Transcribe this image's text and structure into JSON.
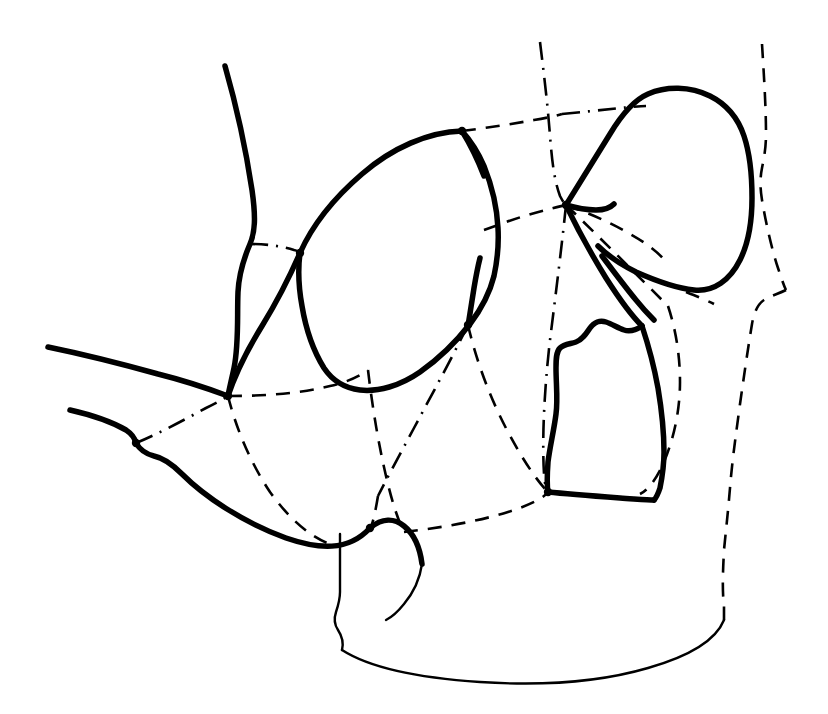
{
  "figure": {
    "kind": "line-drawing",
    "background_color": "#ffffff",
    "ink_color": "#000000",
    "width": 828,
    "height": 714,
    "has_text_labels": false,
    "has_axes": false,
    "has_legend": false,
    "line_styles": {
      "solid_heavy": {
        "width": 5.5,
        "dash": "none"
      },
      "solid_light": {
        "width": 2.4,
        "dash": "none"
      },
      "dashed": {
        "width": 2.6,
        "dash": "14 10"
      },
      "dash_dot": {
        "width": 2.6,
        "dash": "18 8 2 8"
      }
    },
    "junction_nodes": [
      {
        "name": "anterior-tentorial-node",
        "x": 228,
        "y": 396
      },
      {
        "name": "posterior-tentorial-node",
        "x": 566,
        "y": 205
      },
      {
        "name": "ventral-convergence-node",
        "x": 548,
        "y": 492
      },
      {
        "name": "mandibular-articulation-node",
        "x": 370,
        "y": 528
      },
      {
        "name": "ocular-posterior-node",
        "x": 468,
        "y": 325
      },
      {
        "name": "frontal-suture-node",
        "x": 462,
        "y": 131
      },
      {
        "name": "genal-node",
        "x": 300,
        "y": 253
      },
      {
        "name": "labial-node",
        "x": 136,
        "y": 443
      }
    ],
    "paths": [
      {
        "name": "antenna-scape-shaft",
        "style": "solid_heavy",
        "d": "M 225 66 C 237 108, 246 150, 252 190 C 256 218, 255 232, 250 244 C 244 258, 239 272, 238 292 C 237 316, 239 344, 234 368 C 231 382, 229 390, 228 396"
      },
      {
        "name": "gena-anterior-margin",
        "style": "solid_heavy",
        "d": "M 228 396 C 234 378, 246 352, 262 326 C 278 300, 290 276, 300 253"
      },
      {
        "name": "compound-eye-outline",
        "style": "solid_heavy",
        "d": "M 300 253 C 312 226, 334 198, 362 174 C 392 148, 428 132, 462 131 C 470 140, 478 152, 484 166 C 492 186, 497 208, 498 228 C 499 246, 497 262, 494 276 C 490 292, 482 308, 470 324 C 456 342, 440 358, 420 372 C 400 386, 378 392, 360 390 C 344 388, 332 380, 324 368 C 314 352, 306 330, 302 306 C 298 284, 298 268, 300 253 Z"
      },
      {
        "name": "eye-posterior-notch",
        "style": "solid_heavy",
        "d": "M 468 326 C 470 314, 472 300, 474 288 C 476 276, 478 266, 480 258"
      },
      {
        "name": "frons-dorsal-margin",
        "style": "solid_heavy",
        "d": "M 462 131 C 470 144, 478 160, 484 176"
      },
      {
        "name": "vertex-sclerite-outline",
        "style": "solid_heavy",
        "d": "M 566 205 C 578 186, 594 160, 610 134 C 622 114, 634 100, 648 94 C 666 86, 690 86, 710 96 C 726 104, 738 118, 744 136 C 750 154, 752 176, 752 198 C 752 222, 748 244, 740 260 C 730 280, 714 292, 694 290 C 674 288, 654 280, 636 272 C 620 264, 606 254, 598 246"
      },
      {
        "name": "vertex-sclerite-ventral-margin",
        "style": "solid_heavy",
        "d": "M 566 205 C 576 208, 586 210, 596 210 C 604 210, 610 208, 614 204"
      },
      {
        "name": "postgena-anterior-ridge",
        "style": "solid_heavy",
        "d": "M 566 205 C 576 226, 590 252, 606 278 C 620 300, 632 316, 642 326"
      },
      {
        "name": "postgena-inner-ridge",
        "style": "solid_heavy",
        "d": "M 602 256 C 614 272, 626 288, 636 300 C 644 310, 650 316, 654 320"
      },
      {
        "name": "occipital-sclerite-outline",
        "style": "solid_heavy",
        "d": "M 642 326 C 636 330, 630 332, 624 330 C 618 328, 612 324, 606 322 C 600 320, 594 322, 590 328 C 586 334, 582 340, 576 342 C 570 344, 564 344, 560 348 C 556 352, 556 360, 556 368 C 556 384, 558 400, 556 414 C 554 430, 550 446, 548 462 C 547 476, 547 486, 548 492"
      },
      {
        "name": "occipital-sclerite-lateral-margin",
        "style": "solid_heavy",
        "d": "M 642 326 C 648 344, 654 366, 658 388 C 662 412, 664 434, 664 452 C 664 466, 662 478, 660 488 C 658 494, 656 498, 654 500"
      },
      {
        "name": "occipital-sclerite-ventral-margin",
        "style": "solid_heavy",
        "d": "M 548 492 C 568 494, 594 496, 620 498 C 636 499, 648 500, 654 500"
      },
      {
        "name": "labrum-dorsal-margin",
        "style": "solid_heavy",
        "d": "M 48 347 C 82 354, 122 364, 158 374 C 190 382, 212 390, 228 396"
      },
      {
        "name": "maxillary-palp-dorsal",
        "style": "solid_heavy",
        "d": "M 70 410 C 92 415, 112 422, 126 430 C 132 434, 135 439, 136 443"
      },
      {
        "name": "mandible-ventral-margin",
        "style": "solid_heavy",
        "d": "M 136 443 C 140 450, 146 454, 154 456 C 164 458, 172 464, 182 474 C 204 496, 242 522, 286 538 C 318 549, 348 552, 370 528"
      },
      {
        "name": "labium-dorsal-margin",
        "style": "solid_heavy",
        "d": "M 370 528 C 382 518, 394 518, 404 526 C 414 534, 420 548, 422 564"
      },
      {
        "name": "labium-inner-fold",
        "style": "solid_light",
        "d": "M 422 564 C 420 578, 414 592, 404 604 C 396 614, 390 618, 386 620"
      },
      {
        "name": "submentum-left-margin",
        "style": "solid_light",
        "d": "M 340 534 C 340 554, 340 574, 340 592 C 340 600, 338 606, 336 612 C 334 618, 334 624, 338 630 C 342 636, 344 642, 342 650"
      },
      {
        "name": "cervical-ventral-outline",
        "style": "solid_light",
        "d": "M 342 650 C 370 668, 420 678, 480 682 C 540 686, 600 682, 648 668 C 690 656, 716 640, 724 620"
      },
      {
        "name": "gular-suture-long",
        "style": "dashed",
        "d": "M 228 396 C 236 428, 250 462, 270 492 C 290 520, 312 538, 330 544"
      },
      {
        "name": "hypostomal-suture",
        "style": "dashed",
        "d": "M 228 396 C 262 396, 298 394, 330 386 C 348 382, 360 376, 368 370"
      },
      {
        "name": "occipital-suture-lower",
        "style": "dashed",
        "d": "M 368 370 C 372 404, 378 442, 386 476 C 392 502, 398 520, 404 532"
      },
      {
        "name": "subgenal-suture",
        "style": "dashdot",
        "d": "M 136 443 C 158 434, 184 420, 206 408 C 218 402, 225 398, 228 396"
      },
      {
        "name": "epicranial-suture-dorsal",
        "style": "dashdot",
        "d": "M 540 42 C 544 74, 548 108, 550 136 C 552 160, 554 180, 560 196 C 563 202, 565 204, 566 205"
      },
      {
        "name": "epicranial-suture-ventral",
        "style": "dashdot",
        "d": "M 566 205 C 562 244, 556 292, 550 340 C 544 392, 542 440, 544 474 C 545 485, 546 490, 548 492"
      },
      {
        "name": "frontal-suture-lateral",
        "style": "dashed",
        "d": "M 462 131 C 486 128, 512 124, 534 120 C 546 118, 556 116, 562 114"
      },
      {
        "name": "frontal-suture-to-vertex",
        "style": "dashdot",
        "d": "M 562 114 C 582 112, 602 110, 620 108 C 632 107, 640 106, 646 106"
      },
      {
        "name": "ocular-suture-posterior",
        "style": "dashed",
        "d": "M 484 230 C 506 222, 528 214, 546 210 C 556 207, 562 206, 566 205"
      },
      {
        "name": "tentorial-bridge-suture",
        "style": "dashed",
        "d": "M 566 205 C 588 226, 612 250, 632 270 C 648 286, 660 298, 668 306"
      },
      {
        "name": "postoccipital-suture",
        "style": "dashed",
        "d": "M 566 205 C 586 212, 610 222, 630 234 C 648 244, 660 254, 666 262"
      },
      {
        "name": "occipital-foramen-arc",
        "style": "dashed",
        "d": "M 668 306 C 676 330, 680 356, 680 382 C 680 410, 674 438, 664 462 C 656 480, 648 490, 640 494"
      },
      {
        "name": "genal-suture",
        "style": "dashed",
        "d": "M 468 325 C 476 360, 490 398, 508 432 C 524 462, 538 482, 548 492"
      },
      {
        "name": "pleurostomal-suture",
        "style": "dashdot",
        "d": "M 468 325 C 452 358, 432 394, 414 428 C 398 458, 386 480, 378 496"
      },
      {
        "name": "clypeal-suture",
        "style": "dashed",
        "d": "M 378 496 C 376 508, 374 518, 372 524 C 371 527, 370 528, 370 528"
      },
      {
        "name": "labial-suture",
        "style": "dashed",
        "d": "M 404 532 C 438 528, 476 522, 508 512 C 530 505, 544 498, 548 492"
      },
      {
        "name": "antennal-socket-suture",
        "style": "dashdot",
        "d": "M 250 244 C 266 244, 282 246, 294 250 C 298 251, 300 252, 300 253"
      },
      {
        "name": "head-capsule-posterior-outline",
        "style": "dashed",
        "d": "M 762 44 C 764 76, 766 108, 766 134 C 766 148, 764 158, 762 168 C 760 178, 760 188, 762 200 C 766 224, 772 250, 778 268 C 782 280, 784 286, 786 290"
      },
      {
        "name": "head-capsule-posterior-lower",
        "style": "dashed",
        "d": "M 786 290 C 778 294, 770 296, 764 300 C 758 304, 754 312, 752 324 C 748 348, 744 376, 740 404 C 736 434, 732 462, 730 488 C 728 512, 726 530, 724 550 C 723 570, 722 590, 724 606 C 724 614, 724 618, 724 620"
      },
      {
        "name": "occipital-lateral-notch",
        "style": "dashed",
        "d": "M 686 292 C 696 296, 706 300, 714 304"
      }
    ]
  }
}
